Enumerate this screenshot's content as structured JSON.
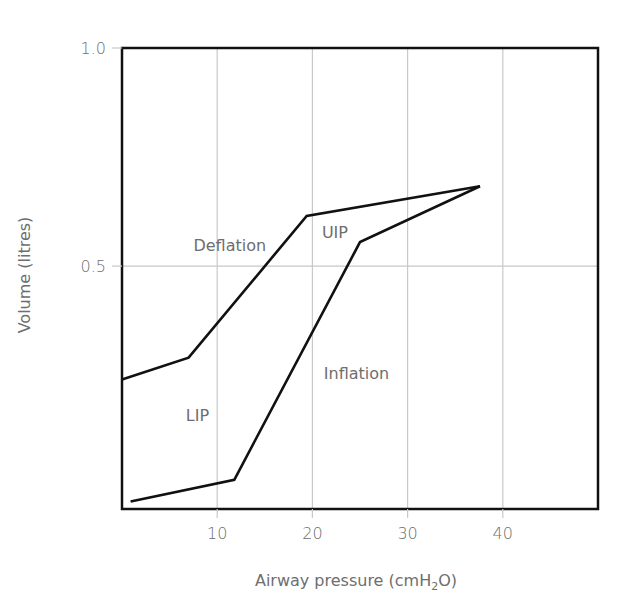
{
  "chart_data": {
    "type": "line",
    "title": "",
    "xlabel": "Airway pressure (cmH2O)",
    "xlabel_parts": {
      "pre": "Airway pressure (cmH",
      "sub": "2",
      "post": "O)"
    },
    "ylabel": "Volume (litres)",
    "xlim": [
      0,
      50
    ],
    "ylim": [
      -0.057,
      1.0
    ],
    "x_ticks": [
      10,
      20,
      30,
      40
    ],
    "x_tick_labels": [
      "10",
      "20",
      "30",
      "40"
    ],
    "y_ticks": [
      0.5,
      1.0
    ],
    "y_tick_labels": [
      "0.5",
      "1.0"
    ],
    "grid": true,
    "legend": null,
    "series": [
      {
        "name": "Inflation",
        "x": [
          0.9,
          11.8,
          25.0,
          37.6
        ],
        "y": [
          -0.04,
          0.01,
          0.555,
          0.683
        ]
      },
      {
        "name": "Deflation",
        "x": [
          0.0,
          7.0,
          19.4,
          37.6
        ],
        "y": [
          0.24,
          0.29,
          0.615,
          0.683
        ]
      }
    ],
    "annotations": [
      {
        "text": "Deflation",
        "x": 7.5,
        "y": 0.535
      },
      {
        "text": "UIP",
        "x": 21.0,
        "y": 0.565
      },
      {
        "text": "Inflation",
        "x": 21.2,
        "y": 0.24
      },
      {
        "text": "LIP",
        "x": 6.7,
        "y": 0.145
      }
    ]
  },
  "colors": {
    "line": "#111111",
    "grid": "#c8c8c8",
    "text": "#6e6e6e",
    "axis": "#111111"
  }
}
